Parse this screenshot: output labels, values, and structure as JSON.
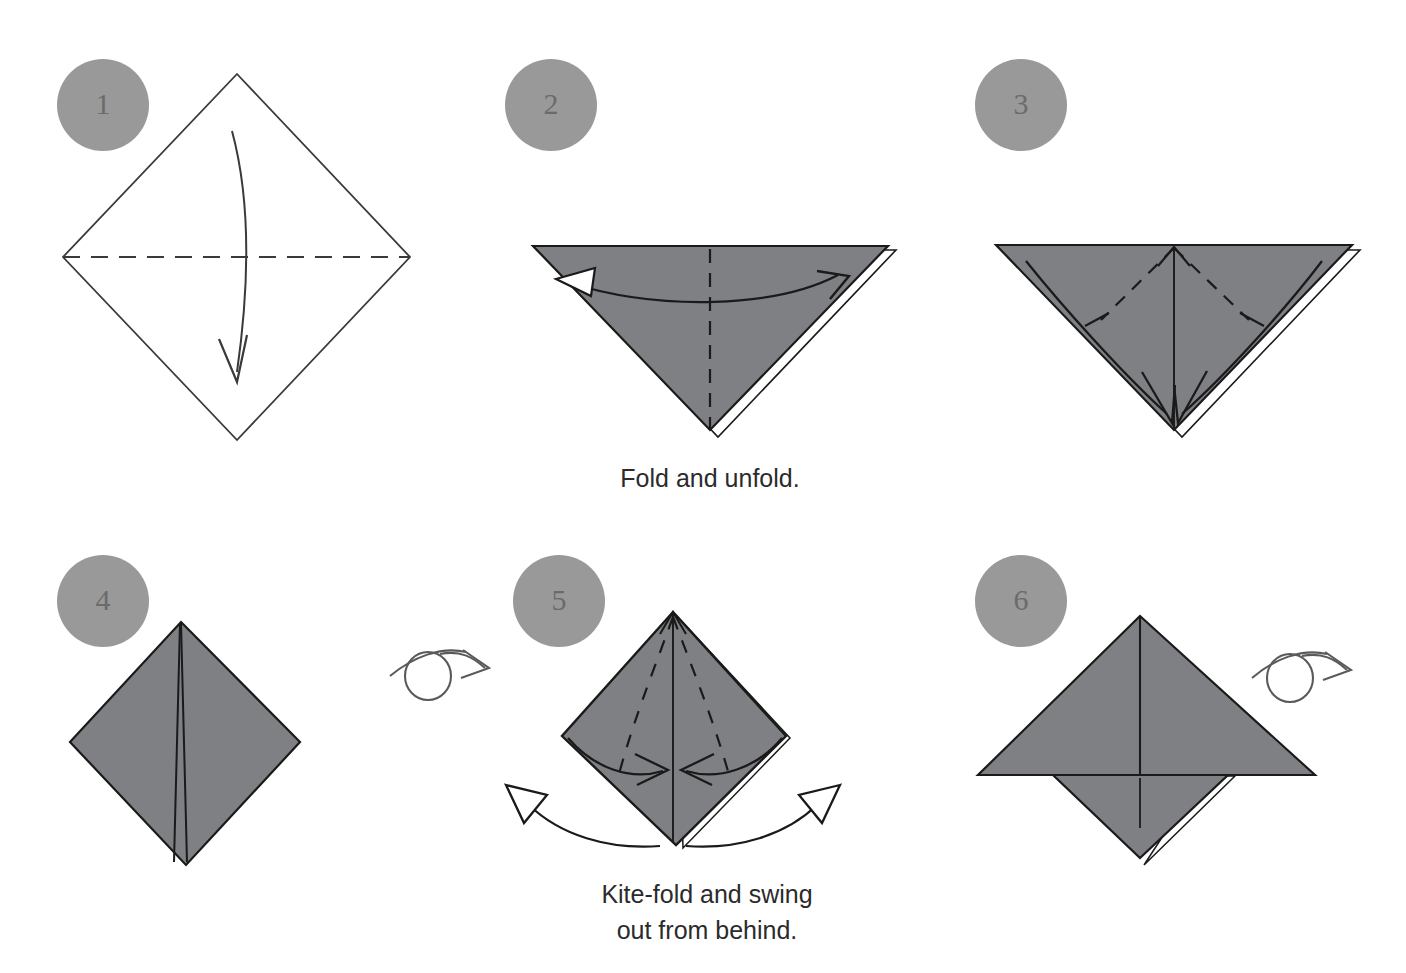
{
  "page": {
    "background_color": "#ffffff",
    "width": 1406,
    "height": 973
  },
  "colors": {
    "paper_front": "#7f8084",
    "paper_back": "#ffffff",
    "outline": "#1a1a1a",
    "thin_outline": "#3a3a3a",
    "badge_fill": "#999999",
    "badge_text": "#6b6b6b",
    "caption_text": "#2b2b2b",
    "arrow": "#1a1a1a",
    "turn_over_arrow": "#5a5a5a"
  },
  "steps": [
    {
      "number": "1",
      "name": "step-1",
      "badge": {
        "cx": 103,
        "cy": 105,
        "r": 46
      },
      "caption": null,
      "shape": "white-diamond",
      "fold_lines": [
        "horizontal-valley-dashed"
      ],
      "arrows": [
        "curved-down-arrow"
      ]
    },
    {
      "number": "2",
      "name": "step-2",
      "badge": {
        "cx": 551,
        "cy": 105,
        "r": 46
      },
      "caption": [
        "Fold and unfold."
      ],
      "shape": "gray-down-triangle",
      "fold_lines": [
        "vertical-center-dashed"
      ],
      "arrows": [
        "double-headed-horizontal-arc"
      ]
    },
    {
      "number": "3",
      "name": "step-3",
      "badge": {
        "cx": 1021,
        "cy": 105,
        "r": 46
      },
      "caption": null,
      "shape": "gray-down-triangle",
      "fold_lines": [
        "v-shaped-dashed-pair",
        "vertical-center-crease"
      ],
      "arrows": [
        "left-corner-to-bottom-arc",
        "right-corner-to-bottom-arc",
        "small-up-valley-arrow"
      ]
    },
    {
      "number": "4",
      "name": "step-4",
      "badge": {
        "cx": 103,
        "cy": 601,
        "r": 46
      },
      "caption": null,
      "shape": "gray-diamond",
      "fold_lines": [
        "vertical-center-crease-double"
      ],
      "arrows": [
        "turn-over-symbol"
      ]
    },
    {
      "number": "5",
      "name": "step-5",
      "badge": {
        "cx": 559,
        "cy": 601,
        "r": 46
      },
      "caption": [
        "Kite-fold and swing",
        "out from behind."
      ],
      "shape": "gray-diamond",
      "fold_lines": [
        "kite-dashed-left",
        "kite-dashed-right",
        "vertical-center-crease"
      ],
      "arrows": [
        "left-inward-arc",
        "right-inward-arc",
        "swing-out-left-hollow",
        "swing-out-right-hollow",
        "small-up-valley-arrow"
      ]
    },
    {
      "number": "6",
      "name": "step-6",
      "badge": {
        "cx": 1021,
        "cy": 601,
        "r": 46
      },
      "caption": null,
      "shape": "gray-winged-shape",
      "fold_lines": [
        "vertical-center-crease"
      ],
      "arrows": [
        "turn-over-symbol"
      ]
    }
  ],
  "captions": {
    "step2": "Fold and unfold.",
    "step5_line1": "Kite-fold and swing",
    "step5_line2": "out from behind."
  },
  "icons": {
    "turn_over": "turn-over-icon",
    "fold_arrow": "fold-arrow-icon",
    "hollow_arrow": "hollow-arrowhead-icon"
  }
}
